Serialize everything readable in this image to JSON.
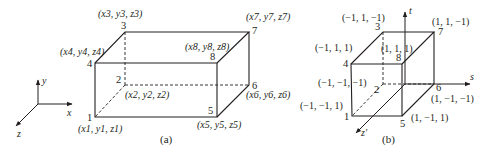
{
  "figure": {
    "panel_a": {
      "caption": "(a)",
      "axes": {
        "x": "x",
        "y": "y",
        "z": "z"
      },
      "vertices": [
        {
          "id": "1",
          "coord": "(x1, y1, z1)"
        },
        {
          "id": "2",
          "coord": "(x2, y2, z2)"
        },
        {
          "id": "3",
          "coord": "(x3, y3, z3)"
        },
        {
          "id": "4",
          "coord": "(x4, y4, z4)"
        },
        {
          "id": "5",
          "coord": "(x5, y5, z5)"
        },
        {
          "id": "6",
          "coord": "(x6, y6, z6)"
        },
        {
          "id": "7",
          "coord": "(x7, y7, z7)"
        },
        {
          "id": "8",
          "coord": "(x8, y8, z8)"
        }
      ]
    },
    "panel_b": {
      "caption": "(b)",
      "axes": {
        "s": "s",
        "t": "t",
        "z": "z′"
      },
      "vertices": [
        {
          "id": "1",
          "coord": "(−1, −1, 1)"
        },
        {
          "id": "2",
          "coord": "(−1, −1, −1)"
        },
        {
          "id": "3",
          "coord": "(−1, 1, −1)"
        },
        {
          "id": "4",
          "coord": "(−1, 1, 1)"
        },
        {
          "id": "5",
          "coord": "(1, −1, 1)"
        },
        {
          "id": "6",
          "coord": "(1, −1, −1)"
        },
        {
          "id": "7",
          "coord": "(1, 1, −1)"
        },
        {
          "id": "8",
          "coord": "(1, 1, 1)"
        }
      ]
    }
  }
}
